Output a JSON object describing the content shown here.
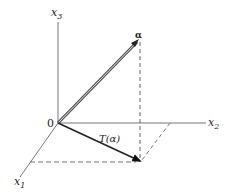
{
  "diagram": {
    "type": "3d-coordinate-vector-projection",
    "axes": {
      "x1": {
        "label": "x",
        "subscript": "1"
      },
      "x2": {
        "label": "x",
        "subscript": "2"
      },
      "x3": {
        "label": "x",
        "subscript": "3"
      }
    },
    "origin_label": "0",
    "vector": {
      "label": "α"
    },
    "projection": {
      "label": "T(α)"
    },
    "colors": {
      "axis": "#777777",
      "vector": "#555555",
      "projection": "#222222",
      "dashed": "#666666"
    }
  }
}
